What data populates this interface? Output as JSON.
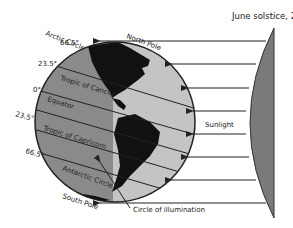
{
  "title": "June solstice, 21 June",
  "labels": {
    "arctic_circle": "Arctic Circle",
    "arctic_deg": "66.5°",
    "north_pole": "North Pole",
    "tropic_cancer_deg": "23.5°",
    "tropic_cancer": "Tropic of Cancer",
    "equator_deg": "0°",
    "equator": "Equator",
    "tropic_capricorn_deg": "23.5°",
    "tropic_capricorn": "Tropic of Capricorn",
    "antarctic_deg": "66.5°",
    "antarctic_circle": "Antarctic Circle",
    "south_pole": "South Pole",
    "sunlight": "Sunlight",
    "circle_of_illumination": "Circle of illumination"
  },
  "colors": {
    "night_side": "#8a8a8a",
    "day_side": "#c4c4c4",
    "land": "#111111",
    "sun": "#7a7a7a",
    "lines": "#222222"
  }
}
